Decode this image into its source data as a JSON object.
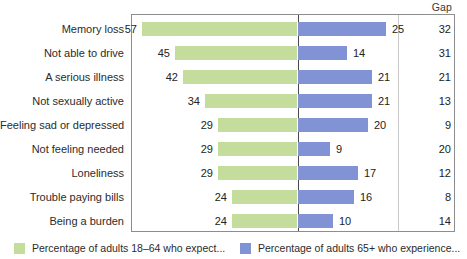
{
  "chart_data": {
    "type": "bar",
    "subtype": "diverging-bidirectional-bar",
    "title": "",
    "xlabel": "",
    "ylabel": "",
    "grid": false,
    "legend_position": "bottom",
    "categories": [
      "Memory loss",
      "Not able to drive",
      "A serious illness",
      "Not sexually active",
      "Feeling sad or depressed",
      "Not feeling needed",
      "Loneliness",
      "Trouble paying bills",
      "Being a burden"
    ],
    "series": [
      {
        "name": "Percentage of adults 18–64 who expect...",
        "direction": "left",
        "color": "#c5dd9c",
        "values": [
          57,
          45,
          42,
          34,
          29,
          29,
          29,
          24,
          24
        ]
      },
      {
        "name": "Percentage of adults 65+ who experience...",
        "direction": "right",
        "color": "#8193d4",
        "values": [
          25,
          14,
          21,
          21,
          20,
          9,
          17,
          16,
          10
        ]
      }
    ],
    "extra_column": {
      "header": "Gap",
      "values": [
        32,
        31,
        21,
        13,
        9,
        20,
        12,
        8,
        14
      ]
    },
    "axis_max_left": 60,
    "axis_max_right": 30
  },
  "colors": {
    "green": "#c5dd9c",
    "blue": "#8193d4",
    "frame": "#8d8d8d",
    "axis": "#4a4a4a",
    "text": "#2b2b2b"
  },
  "legend": {
    "items": [
      {
        "label": "Percentage of adults 18–64 who expect...",
        "swatch": "green"
      },
      {
        "label": "Percentage of adults 65+ who experience...",
        "swatch": "blue"
      }
    ]
  },
  "gap_header": "Gap"
}
